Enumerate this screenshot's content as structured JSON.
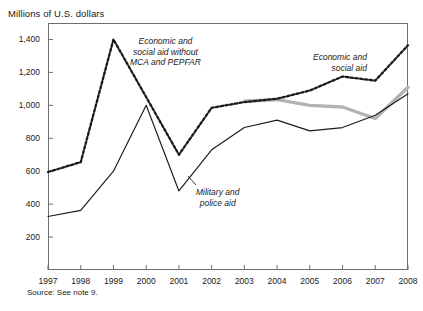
{
  "chart_data": {
    "type": "line",
    "title": "Millions of U.S. dollars",
    "xlabel": "",
    "ylabel": "Millions of U.S. dollars",
    "xlim": [
      1997,
      2008
    ],
    "ylim": [
      0,
      1500
    ],
    "yticks": [
      200,
      400,
      600,
      800,
      1000,
      1200,
      1400
    ],
    "ytick_labels": [
      "200",
      "400",
      "600",
      "800",
      "1,000",
      "1,200",
      "1,400"
    ],
    "x": [
      1997,
      1998,
      1999,
      2000,
      2001,
      2002,
      2003,
      2004,
      2005,
      2006,
      2007,
      2008
    ],
    "xtick_labels": [
      "1997",
      "1998",
      "1999",
      "2000",
      "2001",
      "2002",
      "2003",
      "2004",
      "2005",
      "2006",
      "2007",
      "2008"
    ],
    "grid": false,
    "legend_position": "inline-annotations",
    "series": [
      {
        "name": "Economic and social aid",
        "style": "dashed",
        "color": "#1a1a1a",
        "x": [
          1997,
          1998,
          1999,
          2000,
          2001,
          2002,
          2003,
          2004,
          2005,
          2006,
          2007,
          2008
        ],
        "values": [
          595,
          655,
          1400,
          1050,
          700,
          985,
          1020,
          1040,
          1090,
          1175,
          1150,
          1365
        ]
      },
      {
        "name": "Economic and social aid without MCA and PEPFAR",
        "style": "solid-thick-gray",
        "color": "#b3b3b3",
        "x": [
          2003,
          2004,
          2005,
          2006,
          2007,
          2008
        ],
        "values": [
          1025,
          1035,
          1000,
          990,
          920,
          1110
        ]
      },
      {
        "name": "Military and police aid",
        "style": "solid",
        "color": "#1a1a1a",
        "x": [
          1997,
          1998,
          1999,
          2000,
          2001,
          2002,
          2003,
          2004,
          2005,
          2006,
          2007,
          2008
        ],
        "values": [
          325,
          362,
          600,
          1000,
          480,
          730,
          865,
          910,
          845,
          865,
          940,
          1070
        ]
      }
    ],
    "annotations": [
      {
        "id": "economic-social-without",
        "lines": [
          "Economic and",
          "social aid without",
          "MCA and PEPFAR"
        ]
      },
      {
        "id": "economic-social",
        "lines": [
          "Economic and",
          "social aid"
        ]
      },
      {
        "id": "military-police",
        "lines": [
          "Military and",
          "police aid"
        ]
      }
    ],
    "source": "Source: See note 9."
  }
}
